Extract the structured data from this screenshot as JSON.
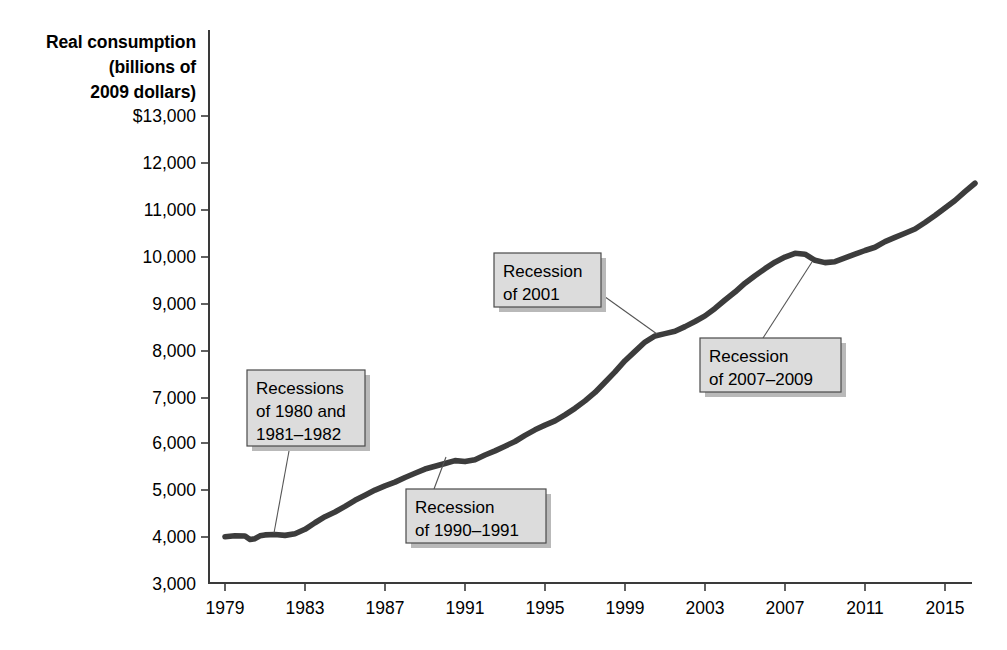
{
  "chart_data": {
    "type": "line",
    "title": "",
    "xlabel": "",
    "ylabel": "Real consumption (billions of 2009 dollars)",
    "ylabel_lines": [
      "Real consumption",
      "(billions of",
      "2009 dollars)"
    ],
    "xlim": [
      1979,
      2017
    ],
    "ylim": [
      3000,
      13000
    ],
    "grid": false,
    "legend": "none",
    "line_color": "#3c3c3c",
    "y_ticks": [
      3000,
      4000,
      5000,
      6000,
      7000,
      8000,
      9000,
      10000,
      11000,
      12000,
      13000
    ],
    "y_tick_labels": [
      "3,000",
      "4,000",
      "5,000",
      "6,000",
      "7,000",
      "8,000",
      "9,000",
      "10,000",
      "11,000",
      "12,000",
      "$13,000"
    ],
    "x_ticks": [
      1979,
      1983,
      1987,
      1991,
      1995,
      1999,
      2003,
      2007,
      2011,
      2015
    ],
    "x_tick_labels": [
      "1979",
      "1983",
      "1987",
      "1991",
      "1995",
      "1999",
      "2003",
      "2007",
      "2011",
      "2015"
    ],
    "series": [
      {
        "name": "Real consumption",
        "x": [
          1979,
          1979.5,
          1980,
          1980.25,
          1980.5,
          1980.75,
          1981,
          1981.5,
          1982,
          1982.5,
          1983,
          1983.5,
          1984,
          1984.5,
          1985,
          1985.5,
          1986,
          1986.5,
          1987,
          1987.5,
          1988,
          1988.5,
          1989,
          1989.5,
          1990,
          1990.5,
          1991,
          1991.5,
          1992,
          1992.5,
          1993,
          1993.5,
          1994,
          1994.5,
          1995,
          1995.5,
          1996,
          1996.5,
          1997,
          1997.5,
          1998,
          1998.5,
          1999,
          1999.5,
          2000,
          2000.5,
          2001,
          2001.5,
          2002,
          2002.5,
          2003,
          2003.5,
          2004,
          2004.5,
          2005,
          2005.5,
          2006,
          2006.5,
          2007,
          2007.5,
          2008,
          2008.5,
          2009,
          2009.5,
          2010,
          2010.5,
          2011,
          2011.5,
          2012,
          2012.5,
          2013,
          2013.5,
          2014,
          2014.5,
          2015,
          2015.5,
          2016,
          2016.5
        ],
        "y": [
          3990,
          4010,
          4005,
          3930,
          3950,
          4010,
          4030,
          4040,
          4020,
          4055,
          4150,
          4290,
          4420,
          4520,
          4640,
          4770,
          4880,
          4990,
          5080,
          5160,
          5260,
          5350,
          5440,
          5500,
          5560,
          5620,
          5600,
          5640,
          5740,
          5830,
          5930,
          6030,
          6160,
          6280,
          6380,
          6470,
          6600,
          6740,
          6900,
          7080,
          7300,
          7520,
          7760,
          7960,
          8160,
          8290,
          8340,
          8390,
          8490,
          8600,
          8720,
          8880,
          9060,
          9230,
          9420,
          9580,
          9730,
          9870,
          9980,
          10060,
          10040,
          9910,
          9860,
          9880,
          9960,
          10040,
          10120,
          10190,
          10310,
          10400,
          10490,
          10580,
          10720,
          10870,
          11030,
          11190,
          11380,
          11560
        ],
        "units": "billions of 2009 dollars"
      }
    ],
    "annotations": [
      {
        "id": "recessions-1980-1982",
        "lines": [
          "Recessions",
          "of 1980 and",
          "1981–1982"
        ],
        "text": "Recessions of 1980 and 1981–1982",
        "points_to_year": 1982.4,
        "points_to_value": 4060
      },
      {
        "id": "recession-1990-1991",
        "lines": [
          "Recession",
          "of 1990–1991"
        ],
        "text": "Recession of 1990–1991",
        "points_to_year": 1990.8,
        "points_to_value": 5620
      },
      {
        "id": "recession-2001",
        "lines": [
          "Recession",
          "of 2001"
        ],
        "text": "Recession of 2001",
        "points_to_year": 2001.4,
        "points_to_value": 8380
      },
      {
        "id": "recession-2007-2009",
        "lines": [
          "Recession",
          "of 2007–2009"
        ],
        "text": "Recession of 2007–2009",
        "points_to_year": 2008.6,
        "points_to_value": 9930
      }
    ]
  },
  "axis_title": {
    "line1": "Real consumption",
    "line2": "(billions of",
    "line3": "2009 dollars)"
  },
  "callouts": {
    "a0": {
      "l1": "Recessions",
      "l2": "of 1980 and",
      "l3": "1981–1982"
    },
    "a1": {
      "l1": "Recession",
      "l2": "of 1990–1991"
    },
    "a2": {
      "l1": "Recession",
      "l2": "of 2001"
    },
    "a3": {
      "l1": "Recession",
      "l2": "of 2007–2009"
    }
  },
  "y_labels": {
    "t10": "$13,000",
    "t9": "12,000",
    "t8": "11,000",
    "t7": "10,000",
    "t6": "9,000",
    "t5": "8,000",
    "t4": "7,000",
    "t3": "6,000",
    "t2": "5,000",
    "t1": "4,000",
    "t0": "3,000"
  },
  "x_labels": {
    "t0": "1979",
    "t1": "1983",
    "t2": "1987",
    "t3": "1991",
    "t4": "1995",
    "t5": "1999",
    "t6": "2003",
    "t7": "2007",
    "t8": "2011",
    "t9": "2015"
  }
}
